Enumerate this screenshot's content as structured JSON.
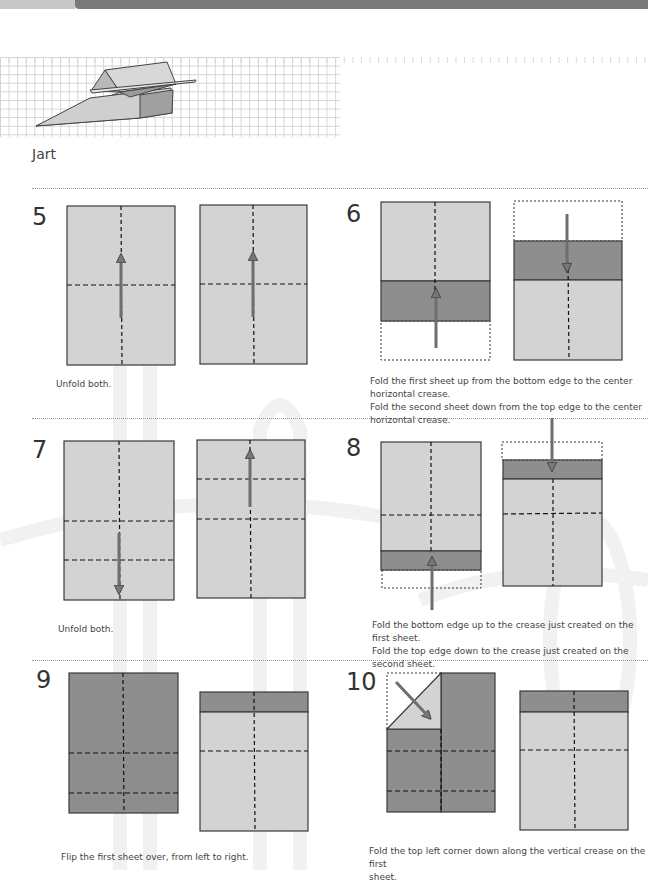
{
  "page": {
    "title": "Jart"
  },
  "colors": {
    "paper_light": "#d3d3d3",
    "paper_dark": "#8e8e8e",
    "outline": "#3a3a3a",
    "arrow": "#6e6e6e",
    "grid_line": "#d4d4d4",
    "top_bar": "#7a7a7a"
  },
  "steps": [
    {
      "number": "5",
      "caption": "Unfold both."
    },
    {
      "number": "6",
      "caption_lines": [
        "Fold the first sheet up from the bottom edge to the center horizontal crease.",
        "Fold the second sheet down from the top edge to the center horizontal crease."
      ]
    },
    {
      "number": "7",
      "caption": "Unfold both."
    },
    {
      "number": "8",
      "caption_lines": [
        "Fold the bottom edge up to the crease just created on the first sheet.",
        "Fold the top edge down to the crease just created on the second sheet."
      ]
    },
    {
      "number": "9",
      "caption": "Flip the first sheet over, from left to right."
    },
    {
      "number": "10",
      "caption_lines": [
        "Fold the top left corner down along the vertical crease on the first",
        "sheet."
      ]
    }
  ]
}
